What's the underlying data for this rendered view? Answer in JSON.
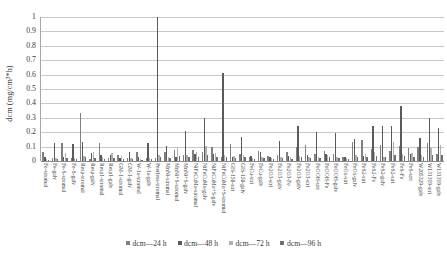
{
  "chart_data": {
    "type": "bar",
    "title": "",
    "xlabel": "",
    "ylabel": "dcm (mg/cm²*h)",
    "ylim": [
      0,
      1
    ],
    "ytick_labels": [
      "1",
      "0.9",
      "0.8",
      "0.7",
      "0.6",
      "0.5",
      "0.4",
      "0.3",
      "0.2",
      "0.1",
      "0"
    ],
    "ytick_values": [
      1,
      0.9,
      0.8,
      0.7,
      0.6,
      0.5,
      0.4,
      0.3,
      0.2,
      0.1,
      0
    ],
    "grid": true,
    "legend_position": "bottom",
    "colors": {
      "dcm_24h": "#808080",
      "dcm_48h": "#5a5a5a",
      "dcm_72h": "#b0b0b0",
      "dcm_96h": "#6e6e6e",
      "gridline": "#c8c8c8",
      "axis": "#8a8a8a",
      "text": "#3a3a3a"
    },
    "categories": [
      "Fe-stromal",
      "Fe-galv",
      "Fe-S-stromal",
      "Fe-S-galv",
      "Resp-stromal",
      "Resp-galv",
      "Resp1-stromal",
      "Resp1-galv",
      "GM-1-stromal",
      "GM-1-galv",
      "W-1a-stromal",
      "W-1a-galv",
      "Peerless-stromal",
      "MnNi-stromal",
      "MnNi+S-stromal",
      "MnNi+S-galv",
      "NiFeCuMo-stromal",
      "NiFeCuMo-galv",
      "NiFeCuMo+S-galv",
      "NiFeCuMo+S-stromal",
      "GIS-150-stri",
      "GIS-150-galv",
      "FeCu-stri",
      "FeCu-galv",
      "Fe2O3-stri",
      "Fe2O3-galv",
      "Fe2O3-Fe",
      "Fe2O3-galv",
      "Fe2O3-stri",
      "FeOOH-stri",
      "FeOOH-Fe",
      "FeOOH-galv",
      "FeOx-stri",
      "FeOx-galv",
      "FeS2-stri",
      "FeS2-Fe",
      "FeS2-galv",
      "FeS2-stri",
      "FeS-Fe",
      "FeS-stri",
      "W205329-galv",
      "W131319-stri",
      "W131319-galv"
    ],
    "series": [
      {
        "name": "dcm—24 h",
        "color": "#808080",
        "values": [
          0.065,
          0.02,
          0.125,
          0.02,
          0.335,
          0.015,
          0.125,
          0.02,
          0.04,
          0.018,
          0.06,
          0.02,
          0.02,
          0.06,
          0.075,
          0.04,
          0.075,
          0.06,
          0.1,
          0.03,
          0.115,
          0.05,
          0.03,
          0.07,
          0.035,
          0.04,
          0.06,
          0.1,
          0.11,
          0.05,
          0.07,
          0.05,
          0.03,
          0.13,
          0.145,
          0.085,
          0.11,
          0.07,
          0.105,
          0.09,
          0.095,
          0.125,
          0.05
        ]
      },
      {
        "name": "dcm—48 h",
        "color": "#5a5a5a",
        "values": [
          0.03,
          0.125,
          0.03,
          0.115,
          0.13,
          0.055,
          0.04,
          0.045,
          0.02,
          0.06,
          0.03,
          0.125,
          1.0,
          0.105,
          0.03,
          0.21,
          0.05,
          0.3,
          0.05,
          0.61,
          0.03,
          0.17,
          0.035,
          0.06,
          0.03,
          0.14,
          0.035,
          0.245,
          0.04,
          0.2,
          0.05,
          0.195,
          0.03,
          0.15,
          0.035,
          0.24,
          0.245,
          0.245,
          0.38,
          0.05,
          0.16,
          0.3,
          0.23
        ]
      },
      {
        "name": "dcm—72 h",
        "color": "#b0b0b0",
        "values": [
          0.015,
          0.02,
          0.055,
          0.02,
          0.035,
          0.06,
          0.025,
          0.055,
          0.035,
          0.02,
          0.015,
          0.02,
          0.045,
          0.03,
          0.09,
          0.045,
          0.065,
          0.105,
          0.055,
          0.045,
          0.035,
          0.04,
          0.02,
          0.03,
          0.02,
          0.03,
          0.025,
          0.035,
          0.03,
          0.03,
          0.04,
          0.03,
          0.02,
          0.045,
          0.05,
          0.06,
          0.03,
          0.135,
          0.05,
          0.055,
          0.045,
          0.09,
          0.11
        ]
      },
      {
        "name": "dcm—96 h",
        "color": "#6e6e6e",
        "values": [
          0.01,
          0.015,
          0.018,
          0.015,
          0.025,
          0.02,
          0.015,
          0.02,
          0.012,
          0.015,
          0.01,
          0.015,
          0.03,
          0.02,
          0.035,
          0.025,
          0.03,
          0.04,
          0.03,
          0.025,
          0.02,
          0.025,
          0.015,
          0.02,
          0.015,
          0.02,
          0.015,
          0.025,
          0.02,
          0.02,
          0.025,
          0.02,
          0.015,
          0.03,
          0.03,
          0.035,
          0.025,
          0.04,
          0.035,
          0.03,
          0.03,
          0.045,
          0.04
        ]
      }
    ]
  }
}
